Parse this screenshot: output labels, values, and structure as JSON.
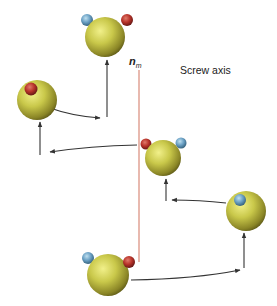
{
  "diagram": {
    "axis_label": "Screw axis",
    "axis_symbol": "n",
    "axis_symbol_subscript": "m",
    "colors": {
      "axis_line": "#d98a7a",
      "sphere_body": "#c9c84a",
      "sphere_shadow": "#6f6a1c",
      "marker_red": "#b8332a",
      "marker_blue": "#6aa0c4",
      "arrow": "#333333"
    },
    "spheres": [
      {
        "id": "sphere-top",
        "cx": 105,
        "cy": 37,
        "r": 20,
        "markers": [
          {
            "color": "blue",
            "cx": 87,
            "cy": 20,
            "r": 6
          },
          {
            "color": "red",
            "cx": 127,
            "cy": 20,
            "r": 6
          }
        ]
      },
      {
        "id": "sphere-left",
        "cx": 37,
        "cy": 100,
        "r": 20,
        "markers": [
          {
            "color": "red",
            "cx": 31,
            "cy": 89,
            "r": 6.5
          }
        ]
      },
      {
        "id": "sphere-middle",
        "cx": 163,
        "cy": 158,
        "r": 18,
        "markers": [
          {
            "color": "red",
            "cx": 146,
            "cy": 144,
            "r": 5.5
          },
          {
            "color": "blue",
            "cx": 181,
            "cy": 143,
            "r": 5.5
          }
        ]
      },
      {
        "id": "sphere-right",
        "cx": 246,
        "cy": 211,
        "r": 20,
        "markers": [
          {
            "color": "blue",
            "cx": 240,
            "cy": 200,
            "r": 6
          }
        ]
      },
      {
        "id": "sphere-bottom",
        "cx": 108,
        "cy": 275,
        "r": 21,
        "markers": [
          {
            "color": "blue",
            "cx": 88,
            "cy": 258,
            "r": 6
          },
          {
            "color": "red",
            "cx": 129,
            "cy": 262,
            "r": 6
          }
        ]
      }
    ]
  }
}
